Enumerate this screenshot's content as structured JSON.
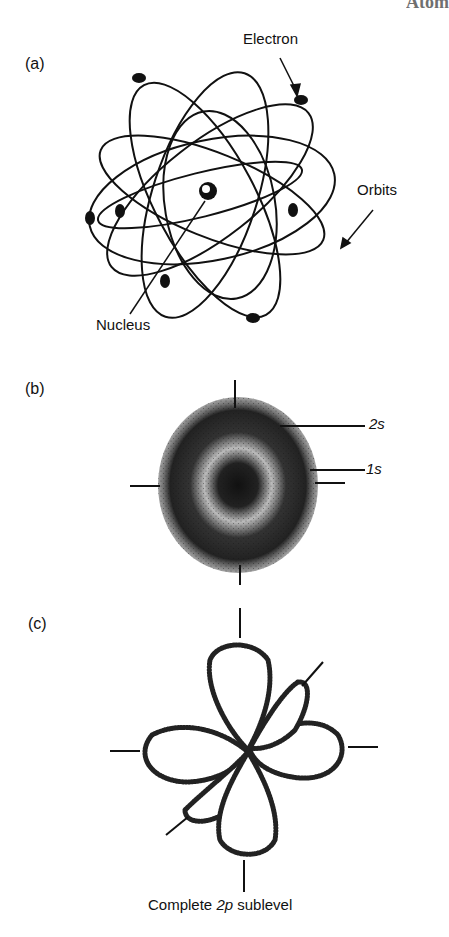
{
  "figure": {
    "corner_fragment": "Atom",
    "panels": [
      {
        "id": "a",
        "label": "(a)",
        "title": "Bohr orbit model",
        "annotations": {
          "electron": "Electron",
          "orbits": "Orbits",
          "nucleus": "Nucleus"
        }
      },
      {
        "id": "b",
        "label": "(b)",
        "title": "s orbital electron clouds",
        "annotations": {
          "outer": "2s",
          "inner": "1s"
        }
      },
      {
        "id": "c",
        "label": "(c)",
        "title": "p orbital lobes",
        "caption_prefix": "Complete ",
        "caption_italic": "2p",
        "caption_suffix": " sublevel"
      }
    ]
  }
}
